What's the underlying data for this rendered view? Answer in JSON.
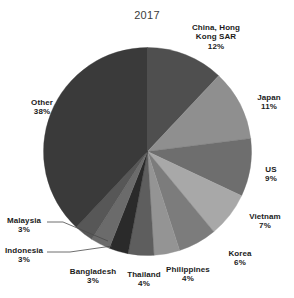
{
  "chart_data": {
    "type": "pie",
    "title": "2017",
    "xlabel": "",
    "ylabel": "",
    "legend": "none",
    "grid": false,
    "value_suffix": "%",
    "start_angle_deg": 0,
    "direction": "clockwise",
    "categories": [
      "China, Hong Kong SAR",
      "Japan",
      "US",
      "Vietnam",
      "Korea",
      "Philippines",
      "Thailand",
      "Bangladesh",
      "Indonesia",
      "Malaysia",
      "Other"
    ],
    "values": [
      12,
      11,
      9,
      7,
      6,
      4,
      4,
      3,
      3,
      3,
      38
    ],
    "colors": [
      "#4f4f4f",
      "#8f8f8f",
      "#6e6e6e",
      "#a8a8a8",
      "#7c7c7c",
      "#949494",
      "#5e5e5e",
      "#2a2a2a",
      "#6b6b6b",
      "#575757",
      "#3a3a3a"
    ],
    "slices": [
      {
        "name": "China, Hong Kong SAR",
        "value": 12,
        "label_lines": [
          "China, Hong",
          "Kong SAR",
          "12%"
        ],
        "color": "#4f4f4f",
        "leader_line": false
      },
      {
        "name": "Japan",
        "value": 11,
        "label_lines": [
          "Japan",
          "11%"
        ],
        "color": "#8f8f8f",
        "leader_line": false
      },
      {
        "name": "US",
        "value": 9,
        "label_lines": [
          "US",
          "9%"
        ],
        "color": "#6e6e6e",
        "leader_line": false
      },
      {
        "name": "Vietnam",
        "value": 7,
        "label_lines": [
          "Vietnam",
          "7%"
        ],
        "color": "#a8a8a8",
        "leader_line": false
      },
      {
        "name": "Korea",
        "value": 6,
        "label_lines": [
          "Korea",
          "6%"
        ],
        "color": "#7c7c7c",
        "leader_line": false
      },
      {
        "name": "Philippines",
        "value": 4,
        "label_lines": [
          "Philippines",
          "4%"
        ],
        "color": "#949494",
        "leader_line": false
      },
      {
        "name": "Thailand",
        "value": 4,
        "label_lines": [
          "Thailand",
          "4%"
        ],
        "color": "#5e5e5e",
        "leader_line": false
      },
      {
        "name": "Bangladesh",
        "value": 3,
        "label_lines": [
          "Bangladesh",
          "3%"
        ],
        "color": "#2a2a2a",
        "leader_line": false
      },
      {
        "name": "Indonesia",
        "value": 3,
        "label_lines": [
          "Indonesia",
          "3%"
        ],
        "color": "#6b6b6b",
        "leader_line": true
      },
      {
        "name": "Malaysia",
        "value": 3,
        "label_lines": [
          "Malaysia",
          "3%"
        ],
        "color": "#575757",
        "leader_line": true
      },
      {
        "name": "Other",
        "value": 38,
        "label_lines": [
          "Other",
          "38%"
        ],
        "color": "#3a3a3a",
        "leader_line": false
      }
    ]
  },
  "labels": {
    "china": {
      "l1": "China, Hong",
      "l2": "Kong SAR",
      "l3": "12%"
    },
    "japan": {
      "l1": "Japan",
      "l2": "11%"
    },
    "us": {
      "l1": "US",
      "l2": "9%"
    },
    "vietnam": {
      "l1": "Vietnam",
      "l2": "7%"
    },
    "korea": {
      "l1": "Korea",
      "l2": "6%"
    },
    "philippines": {
      "l1": "Philippines",
      "l2": "4%"
    },
    "thailand": {
      "l1": "Thailand",
      "l2": "4%"
    },
    "bangladesh": {
      "l1": "Bangladesh",
      "l2": "3%"
    },
    "indonesia": {
      "l1": "Indonesia",
      "l2": "3%"
    },
    "malaysia": {
      "l1": "Malaysia",
      "l2": "3%"
    },
    "other": {
      "l1": "Other",
      "l2": "38%"
    }
  }
}
